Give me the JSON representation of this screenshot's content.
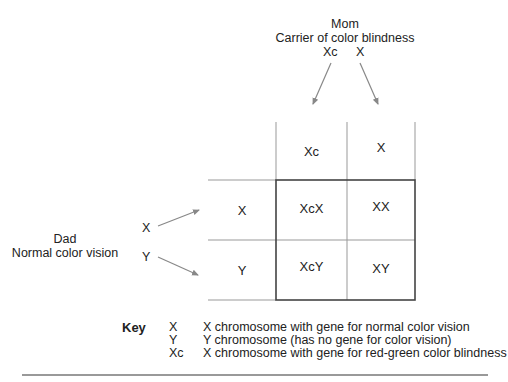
{
  "mom": {
    "title": "Mom",
    "subtitle": "Carrier of color blindness",
    "alleles": [
      "Xc",
      "X"
    ]
  },
  "dad": {
    "title": "Dad",
    "subtitle": "Normal color vision",
    "alleles": [
      "X",
      "Y"
    ]
  },
  "punnett": {
    "col_headers": [
      "Xc",
      "X"
    ],
    "row_headers": [
      "X",
      "Y"
    ],
    "cells": [
      [
        "XcX",
        "XX"
      ],
      [
        "XcY",
        "XY"
      ]
    ]
  },
  "key": {
    "label": "Key",
    "entries": [
      {
        "symbol": "X",
        "description": "X chromosome with gene for normal color vision"
      },
      {
        "symbol": "Y",
        "description": "Y chromosome (has no gene for color vision)"
      },
      {
        "symbol": "Xc",
        "description": "X chromosome with gene for red-green color blindness"
      }
    ]
  },
  "colors": {
    "line": "#555555",
    "thin_line": "#888888",
    "arrow": "#888888",
    "text": "#222222"
  }
}
